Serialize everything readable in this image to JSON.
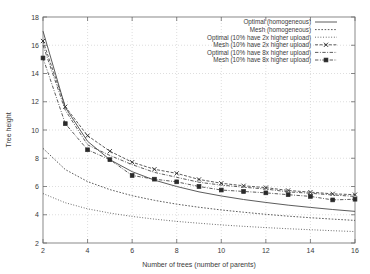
{
  "chart_data": {
    "type": "line",
    "title": "",
    "xlabel": "Number of trees (number of parents)",
    "ylabel": "Tree height",
    "xlim": [
      2,
      16
    ],
    "ylim": [
      2,
      18
    ],
    "xticks": [
      2,
      4,
      6,
      8,
      10,
      12,
      14,
      16
    ],
    "yticks": [
      2,
      4,
      6,
      8,
      10,
      12,
      14,
      16,
      18
    ],
    "grid": true,
    "legend_position": "top-right",
    "x": [
      2,
      3,
      4,
      5,
      6,
      7,
      8,
      9,
      10,
      11,
      12,
      13,
      14,
      15,
      16
    ],
    "series": [
      {
        "name": "Optimal (homogeneous)",
        "style": "solid",
        "marker": "none",
        "values": [
          17.0,
          11.6,
          9.2,
          7.9,
          7.05,
          6.45,
          6.0,
          5.62,
          5.33,
          5.08,
          4.87,
          4.68,
          4.52,
          4.37,
          4.24
        ]
      },
      {
        "name": "Mesh (homogeneous)",
        "style": "dotted",
        "marker": "none",
        "values": [
          8.7,
          7.2,
          6.35,
          5.78,
          5.35,
          5.02,
          4.75,
          4.53,
          4.34,
          4.18,
          4.03,
          3.9,
          3.79,
          3.69,
          3.6
        ]
      },
      {
        "name": "Optimal (10% have 2x higher upload)",
        "style": "fine-dotted",
        "marker": "none",
        "values": [
          5.5,
          4.85,
          4.42,
          4.12,
          3.88,
          3.69,
          3.53,
          3.4,
          3.28,
          3.18,
          3.09,
          3.01,
          2.94,
          2.87,
          2.81
        ]
      },
      {
        "name": "Mesh (10% have 2x higher upload)",
        "style": "dashed",
        "marker": "x",
        "values": [
          16.3,
          11.65,
          9.6,
          8.5,
          7.72,
          7.22,
          6.93,
          6.5,
          6.23,
          6.05,
          5.92,
          5.72,
          5.6,
          5.48,
          5.42
        ]
      },
      {
        "name": "Optimal (10% have 8x higher upload)",
        "style": "dash-dot",
        "marker": "none",
        "values": [
          16.0,
          11.4,
          8.95,
          8.2,
          7.55,
          7.0,
          6.65,
          6.3,
          6.1,
          5.95,
          5.82,
          5.62,
          5.52,
          5.4,
          5.3
        ]
      },
      {
        "name": "Mesh (10% have 8x higher upload)",
        "style": "dash-dot",
        "marker": "square",
        "values": [
          15.1,
          10.45,
          8.6,
          7.9,
          6.78,
          6.52,
          6.33,
          6.0,
          5.75,
          5.65,
          5.55,
          5.42,
          5.3,
          5.05,
          5.1
        ]
      }
    ]
  },
  "legend": {
    "entries": [
      "Optimal (homogeneous)",
      "Mesh (homogeneous)",
      "Optimal (10% have 2x higher upload)",
      "Mesh (10% have 2x higher upload)",
      "Optimal (10% have 8x higher upload)",
      "Mesh (10% have 8x higher upload)"
    ]
  },
  "colors": {
    "background": "#ffffff",
    "frame": "#6b6b6b",
    "grid": "#c8c8c8",
    "line": "#4a4a4a",
    "text": "#3a3a3a"
  }
}
